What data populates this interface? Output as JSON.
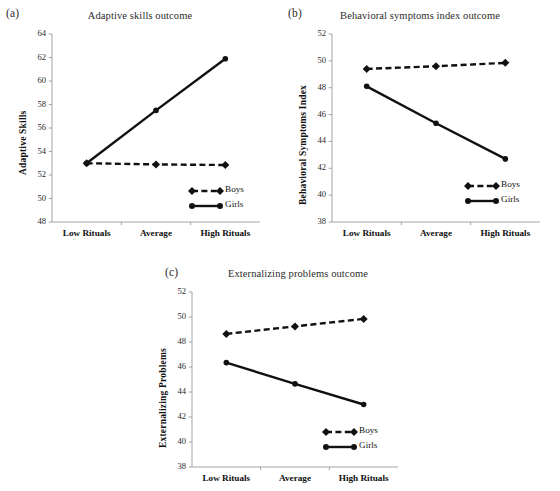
{
  "figure": {
    "background": "#ffffff",
    "series_color": "#111111",
    "width": 560,
    "height": 491
  },
  "legend": {
    "boys_label": "Boys",
    "girls_label": "Girls",
    "boys_style": "dashed-line-with-diamond-markers",
    "girls_style": "solid-line-with-circle-markers"
  },
  "panels": [
    {
      "key": "a",
      "label": "(a)",
      "title": "Adaptive skills outcome"
    },
    {
      "key": "b",
      "label": "(b)",
      "title": "Behavioral symptoms index outcome"
    },
    {
      "key": "c",
      "label": "(c)",
      "title": "Externalizing problems outcome"
    }
  ],
  "chart_data": [
    {
      "type": "line",
      "panel": "a",
      "title": "Adaptive skills outcome",
      "xlabel": "",
      "ylabel": "Adaptive Skills",
      "categories": [
        "Low Rituals",
        "Average",
        "High Rituals"
      ],
      "ylim": [
        48,
        64
      ],
      "yticks": [
        48,
        50,
        52,
        54,
        56,
        58,
        60,
        62,
        64
      ],
      "grid": false,
      "legend_position": "bottom-right-inside",
      "series": [
        {
          "name": "Boys",
          "style": "dashed",
          "marker": "diamond",
          "values": [
            53.0,
            52.9,
            52.85
          ]
        },
        {
          "name": "Girls",
          "style": "solid",
          "marker": "circle",
          "values": [
            53.0,
            57.5,
            61.9
          ]
        }
      ]
    },
    {
      "type": "line",
      "panel": "b",
      "title": "Behavioral symptoms index outcome",
      "xlabel": "",
      "ylabel": "Behavioral Symptoms Index",
      "categories": [
        "Low Rituals",
        "Average",
        "High Rituals"
      ],
      "ylim": [
        38,
        52
      ],
      "yticks": [
        38,
        40,
        42,
        44,
        46,
        48,
        50,
        52
      ],
      "grid": false,
      "legend_position": "bottom-right-inside",
      "series": [
        {
          "name": "Boys",
          "style": "dashed",
          "marker": "diamond",
          "values": [
            49.4,
            49.6,
            49.85
          ]
        },
        {
          "name": "Girls",
          "style": "solid",
          "marker": "circle",
          "values": [
            48.1,
            45.35,
            42.7
          ]
        }
      ]
    },
    {
      "type": "line",
      "panel": "c",
      "title": "Externalizing problems outcome",
      "xlabel": "",
      "ylabel": "Externalizing Problems",
      "categories": [
        "Low Rituals",
        "Average",
        "High Rituals"
      ],
      "ylim": [
        38,
        52
      ],
      "yticks": [
        38,
        40,
        42,
        44,
        46,
        48,
        50,
        52
      ],
      "grid": false,
      "legend_position": "bottom-right-inside",
      "series": [
        {
          "name": "Boys",
          "style": "dashed",
          "marker": "diamond",
          "values": [
            48.65,
            49.25,
            49.85
          ]
        },
        {
          "name": "Girls",
          "style": "solid",
          "marker": "circle",
          "values": [
            46.35,
            44.65,
            43.0
          ]
        }
      ]
    }
  ]
}
